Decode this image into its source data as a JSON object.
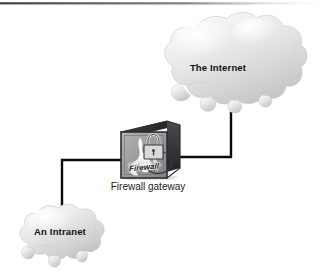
{
  "diagram": {
    "background_color": "#ffffff",
    "width": 335,
    "height": 277,
    "line_color": "#000000",
    "cloud_fill_light": "#f2f2f2",
    "cloud_fill_mid": "#d5d5d5",
    "cloud_fill_dark": "#b9b9b9",
    "device_face_color": "#9a9a9a",
    "device_shadow_color": "#2b2b30"
  },
  "nodes": {
    "internet": {
      "label": "The Internet",
      "shape": "cloud",
      "x": 218,
      "y": 68
    },
    "intranet": {
      "label": "An Intranet",
      "shape": "cloud",
      "x": 60,
      "y": 232
    },
    "firewall": {
      "caption": "Firewall gateway",
      "device_word": "Firewall",
      "shape": "3d-box",
      "x": 148,
      "y": 150,
      "icons": [
        "flame-icon",
        "padlock-icon"
      ]
    }
  },
  "connections": [
    {
      "name": "firewall-to-internet",
      "from": "firewall",
      "to": "internet",
      "style": "orthogonal"
    },
    {
      "name": "firewall-to-intranet",
      "from": "firewall",
      "to": "intranet",
      "style": "orthogonal"
    }
  ],
  "artifacts": {
    "top_scan_line": "scan-edge-line"
  }
}
